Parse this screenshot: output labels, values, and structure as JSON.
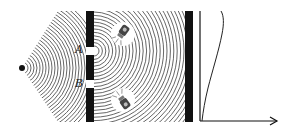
{
  "diagram": {
    "type": "double-slit-experiment",
    "colors": {
      "ink": "#111111",
      "wave": "#555555",
      "background": "#ffffff"
    },
    "source": {
      "x": 22,
      "y": 68
    },
    "barrier1": {
      "x": 86,
      "width": 8,
      "top": 11,
      "bottom": 122
    },
    "slits": [
      {
        "label": "A",
        "top": 47,
        "bottom": 55
      },
      {
        "label": "B",
        "top": 80,
        "bottom": 88
      }
    ],
    "barrier2": {
      "x": 185,
      "width": 8,
      "top": 11,
      "bottom": 122
    },
    "detectors": [
      {
        "name": "flashlight-upper",
        "x": 123,
        "y": 34
      },
      {
        "name": "flashlight-lower",
        "x": 123,
        "y": 100
      }
    ],
    "plot": {
      "origin": {
        "x": 200,
        "y": 121
      },
      "axis_top": 11,
      "arrow_end_x": 277,
      "curve": "intensity distribution"
    }
  }
}
